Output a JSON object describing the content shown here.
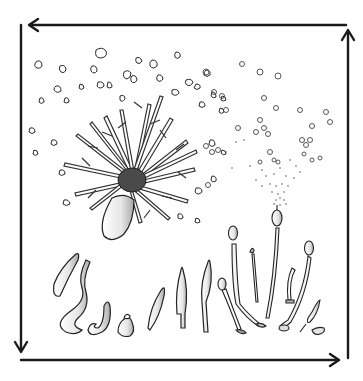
{
  "figure": {
    "description": "Cyclic life-cycle illustration: a branching organism releasing fragments (left), stalked fruiting bodies releasing spores (right), and a row of developmental stages along the bottom, enclosed by a clockwise-reversed arrow loop",
    "colors": {
      "background": "#ffffff",
      "ink": "#1a1a1a",
      "shade": "#bdbdbd"
    },
    "cycle_arrows": [
      {
        "id": "top",
        "direction": "left",
        "from": [
          346,
          25
        ],
        "to": [
          28,
          25
        ]
      },
      {
        "id": "left",
        "direction": "down",
        "from": [
          21,
          25
        ],
        "to": [
          21,
          352
        ]
      },
      {
        "id": "bottom",
        "direction": "right",
        "from": [
          21,
          360
        ],
        "to": [
          340,
          360
        ]
      },
      {
        "id": "right",
        "direction": "up",
        "from": [
          348,
          358
        ],
        "to": [
          348,
          30
        ]
      }
    ],
    "groups": [
      {
        "id": "branching-colony",
        "label": "branching colony with released fragments",
        "center": [
          130,
          170
        ]
      },
      {
        "id": "spore-release",
        "label": "stalked body releasing spores",
        "center": [
          280,
          140
        ]
      },
      {
        "id": "developmental-stages",
        "label": "row of developmental stages",
        "y_range": [
          245,
          335
        ]
      }
    ]
  }
}
